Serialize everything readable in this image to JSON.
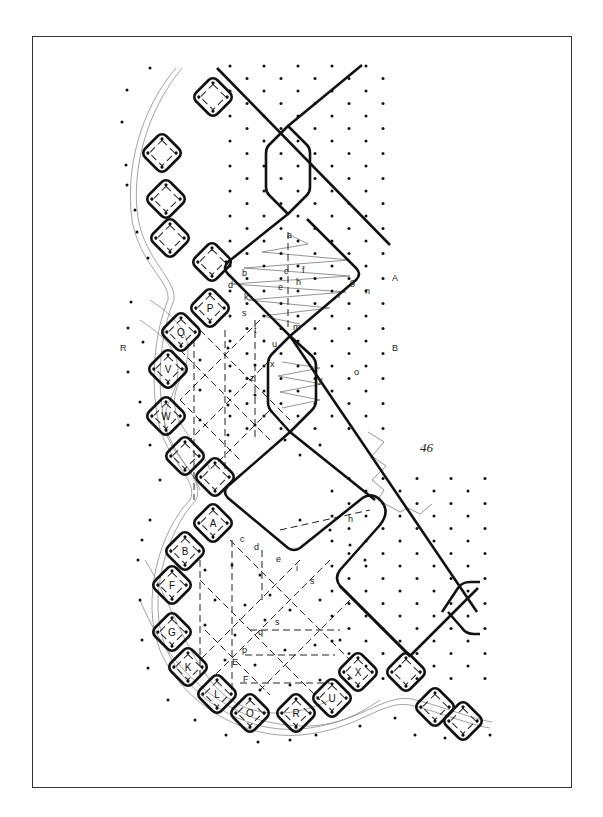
{
  "figure": {
    "type": "bobbin-lace-pricking",
    "page_number": "46",
    "frame": {
      "x": 32,
      "y": 36,
      "w": 540,
      "h": 752
    },
    "colors": {
      "ink": "#111111",
      "thread_grey": "#999999",
      "zigzag_grey": "#888888",
      "background": "#ffffff"
    }
  },
  "side_labels": [
    {
      "text": "A",
      "x": 392,
      "y": 281
    },
    {
      "text": "B",
      "x": 392,
      "y": 351
    },
    {
      "text": "R",
      "x": 120,
      "y": 351
    }
  ],
  "pin_labels": [
    {
      "text": "a",
      "x": 287,
      "y": 238
    },
    {
      "text": "b",
      "x": 242,
      "y": 276
    },
    {
      "text": "c",
      "x": 284,
      "y": 274
    },
    {
      "text": "f",
      "x": 302,
      "y": 273
    },
    {
      "text": "d",
      "x": 228,
      "y": 288
    },
    {
      "text": "e",
      "x": 278,
      "y": 290
    },
    {
      "text": "h",
      "x": 296,
      "y": 285
    },
    {
      "text": "g",
      "x": 350,
      "y": 285
    },
    {
      "text": "n",
      "x": 365,
      "y": 294
    },
    {
      "text": "k",
      "x": 244,
      "y": 300
    },
    {
      "text": "i",
      "x": 338,
      "y": 298
    },
    {
      "text": "s",
      "x": 242,
      "y": 316
    },
    {
      "text": "t",
      "x": 254,
      "y": 333
    },
    {
      "text": "m",
      "x": 293,
      "y": 330
    },
    {
      "text": "u",
      "x": 272,
      "y": 347
    },
    {
      "text": "x",
      "x": 270,
      "y": 367
    },
    {
      "text": "z",
      "x": 250,
      "y": 381
    },
    {
      "text": "y",
      "x": 318,
      "y": 383
    },
    {
      "text": "o",
      "x": 354,
      "y": 375
    },
    {
      "text": "c",
      "x": 240,
      "y": 542
    },
    {
      "text": "d",
      "x": 254,
      "y": 550
    },
    {
      "text": "e",
      "x": 276,
      "y": 562
    },
    {
      "text": "h",
      "x": 348,
      "y": 522
    },
    {
      "text": "i",
      "x": 296,
      "y": 571
    },
    {
      "text": "s",
      "x": 310,
      "y": 584
    },
    {
      "text": "s",
      "x": 275,
      "y": 625
    },
    {
      "text": "q",
      "x": 258,
      "y": 635
    },
    {
      "text": "p",
      "x": 242,
      "y": 653
    },
    {
      "text": "E",
      "x": 232,
      "y": 665
    },
    {
      "text": "F",
      "x": 243,
      "y": 682
    }
  ],
  "boxes": [
    {
      "label": "",
      "cx": 213,
      "cy": 97
    },
    {
      "label": "",
      "cx": 162,
      "cy": 153
    },
    {
      "label": "",
      "cx": 166,
      "cy": 199
    },
    {
      "label": "",
      "cx": 170,
      "cy": 238
    },
    {
      "label": "",
      "cx": 212,
      "cy": 262
    },
    {
      "label": "P",
      "cx": 210,
      "cy": 308
    },
    {
      "label": "Q",
      "cx": 181,
      "cy": 332
    },
    {
      "label": "V",
      "cx": 168,
      "cy": 369
    },
    {
      "label": "W",
      "cx": 166,
      "cy": 416
    },
    {
      "label": "",
      "cx": 185,
      "cy": 456
    },
    {
      "label": "",
      "cx": 215,
      "cy": 477
    },
    {
      "label": "A",
      "cx": 213,
      "cy": 523
    },
    {
      "label": "B",
      "cx": 185,
      "cy": 551
    },
    {
      "label": "F",
      "cx": 172,
      "cy": 585
    },
    {
      "label": "G",
      "cx": 172,
      "cy": 632
    },
    {
      "label": "K",
      "cx": 188,
      "cy": 667
    },
    {
      "label": "L",
      "cx": 217,
      "cy": 694
    },
    {
      "label": "O",
      "cx": 250,
      "cy": 713
    },
    {
      "label": "R",
      "cx": 296,
      "cy": 713
    },
    {
      "label": "U",
      "cx": 332,
      "cy": 698
    },
    {
      "label": "X",
      "cx": 358,
      "cy": 672
    },
    {
      "label": "",
      "cx": 406,
      "cy": 672
    },
    {
      "label": "",
      "cx": 435,
      "cy": 707
    },
    {
      "label": "",
      "cx": 463,
      "cy": 721
    }
  ]
}
